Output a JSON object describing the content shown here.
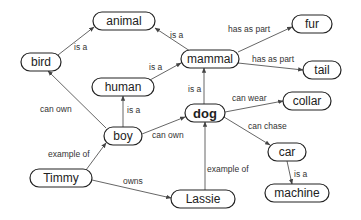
{
  "diagram": {
    "type": "concept-map",
    "nodes": [
      {
        "id": "animal",
        "label": "animal",
        "x": 124,
        "y": 21,
        "w": 62,
        "h": 18,
        "bold": false
      },
      {
        "id": "bird",
        "label": "bird",
        "x": 41,
        "y": 62,
        "w": 40,
        "h": 18,
        "bold": false
      },
      {
        "id": "mammal",
        "label": "mammal",
        "x": 210,
        "y": 59,
        "w": 58,
        "h": 18,
        "bold": false
      },
      {
        "id": "human",
        "label": "human",
        "x": 123,
        "y": 87,
        "w": 62,
        "h": 18,
        "bold": false
      },
      {
        "id": "fur",
        "label": "fur",
        "x": 312,
        "y": 24,
        "w": 40,
        "h": 18,
        "bold": false
      },
      {
        "id": "tail",
        "label": "tail",
        "x": 322,
        "y": 70,
        "w": 38,
        "h": 18,
        "bold": false
      },
      {
        "id": "boy",
        "label": "boy",
        "x": 123,
        "y": 136,
        "w": 38,
        "h": 18,
        "bold": false
      },
      {
        "id": "dog",
        "label": "dog",
        "x": 205,
        "y": 113,
        "w": 40,
        "h": 18,
        "bold": true
      },
      {
        "id": "collar",
        "label": "collar",
        "x": 307,
        "y": 101,
        "w": 48,
        "h": 18,
        "bold": false
      },
      {
        "id": "car",
        "label": "car",
        "x": 287,
        "y": 152,
        "w": 38,
        "h": 18,
        "bold": false
      },
      {
        "id": "machine",
        "label": "machine",
        "x": 297,
        "y": 193,
        "w": 64,
        "h": 18,
        "bold": false
      },
      {
        "id": "Timmy",
        "label": "Timmy",
        "x": 61,
        "y": 178,
        "w": 62,
        "h": 18,
        "bold": false
      },
      {
        "id": "Lassie",
        "label": "Lassie",
        "x": 203,
        "y": 199,
        "w": 64,
        "h": 18,
        "bold": false
      }
    ],
    "edges": [
      {
        "from": "bird",
        "to": "animal",
        "label": "is a",
        "x1": 58,
        "y1": 55,
        "x2": 94,
        "y2": 27,
        "lx": 74,
        "ly": 50
      },
      {
        "from": "mammal",
        "to": "animal",
        "label": "is a",
        "x1": 190,
        "y1": 51,
        "x2": 155,
        "y2": 28,
        "lx": 170,
        "ly": 38
      },
      {
        "from": "human",
        "to": "mammal",
        "label": "is a",
        "x1": 150,
        "y1": 80,
        "x2": 181,
        "y2": 63,
        "lx": 149,
        "ly": 70
      },
      {
        "from": "mammal",
        "to": "fur",
        "label": "has as part",
        "x1": 238,
        "y1": 52,
        "x2": 292,
        "y2": 27,
        "lx": 228,
        "ly": 32
      },
      {
        "from": "mammal",
        "to": "tail",
        "label": "has as part",
        "x1": 238,
        "y1": 63,
        "x2": 303,
        "y2": 70,
        "lx": 252,
        "ly": 62
      },
      {
        "from": "dog",
        "to": "mammal",
        "label": "is a",
        "x1": 204,
        "y1": 104,
        "x2": 204,
        "y2": 68,
        "lx": 188,
        "ly": 92
      },
      {
        "from": "boy",
        "to": "human",
        "label": "is a",
        "x1": 123,
        "y1": 127,
        "x2": 123,
        "y2": 96,
        "lx": 127,
        "ly": 113
      },
      {
        "from": "boy",
        "to": "bird",
        "label": "can own",
        "x1": 106,
        "y1": 128,
        "x2": 48,
        "y2": 71,
        "lx": 40,
        "ly": 112
      },
      {
        "from": "boy",
        "to": "dog",
        "label": "can own",
        "x1": 142,
        "y1": 134,
        "x2": 185,
        "y2": 117,
        "lx": 152,
        "ly": 138
      },
      {
        "from": "dog",
        "to": "collar",
        "label": "can wear",
        "x1": 225,
        "y1": 112,
        "x2": 283,
        "y2": 101,
        "lx": 232,
        "ly": 101
      },
      {
        "from": "dog",
        "to": "car",
        "label": "can chase",
        "x1": 224,
        "y1": 117,
        "x2": 270,
        "y2": 145,
        "lx": 248,
        "ly": 129
      },
      {
        "from": "car",
        "to": "machine",
        "label": "is a",
        "x1": 287,
        "y1": 161,
        "x2": 292,
        "y2": 184,
        "lx": 294,
        "ly": 177
      },
      {
        "from": "Timmy",
        "to": "boy",
        "label": "example of",
        "x1": 86,
        "y1": 170,
        "x2": 106,
        "y2": 143,
        "lx": 48,
        "ly": 157
      },
      {
        "from": "Timmy",
        "to": "Lassie",
        "label": "owns",
        "x1": 92,
        "y1": 180,
        "x2": 171,
        "y2": 198,
        "lx": 123,
        "ly": 184
      },
      {
        "from": "Lassie",
        "to": "dog",
        "label": "example of",
        "x1": 205,
        "y1": 190,
        "x2": 205,
        "y2": 122,
        "lx": 207,
        "ly": 172
      }
    ]
  }
}
